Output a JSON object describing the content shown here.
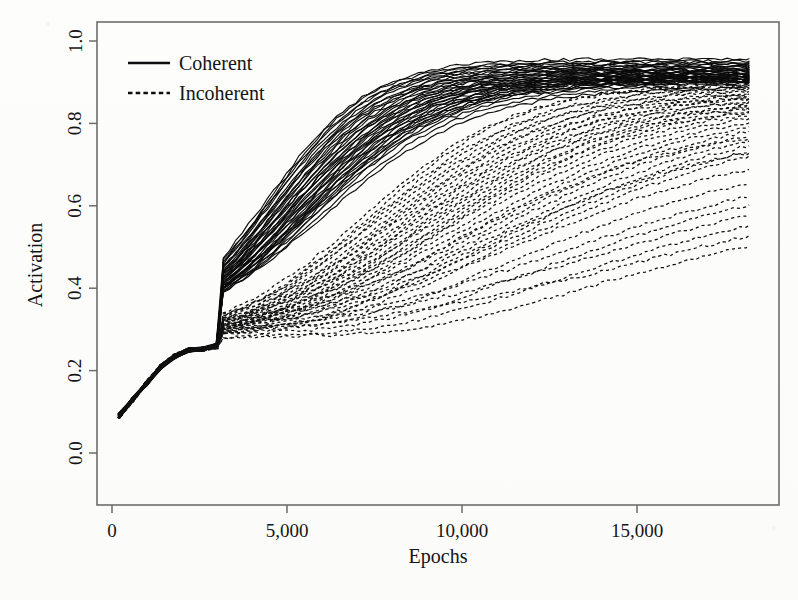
{
  "figure": {
    "background_color": "#fdfdfc",
    "ink_color": "#111111",
    "frame_color": "#6d6d6d"
  },
  "chart_data": {
    "type": "line",
    "title": "",
    "xlabel": "Epochs",
    "ylabel": "Activation",
    "xlim": [
      0,
      18400
    ],
    "ylim": [
      0.0,
      1.0
    ],
    "xticks": [
      0,
      5000,
      10000,
      15000
    ],
    "xticklabels": [
      "0",
      "5,000",
      "10,000",
      "15,000"
    ],
    "yticks": [
      0.0,
      0.2,
      0.4,
      0.6,
      0.8,
      1.0
    ],
    "yticklabels": [
      "0.0",
      "0.2",
      "0.4",
      "0.6",
      "0.8",
      "1.0"
    ],
    "grid": false,
    "legend_position": "top-left",
    "legend": [
      {
        "label": "Coherent",
        "style": "solid"
      },
      {
        "label": "Incoherent",
        "style": "dashed"
      }
    ],
    "x_start_of_data": 200,
    "x_end_of_data": 18200,
    "series_groups": [
      {
        "name": "Coherent",
        "style": "solid",
        "n_traces": 40,
        "description": "Sigmoidal rise beginning near epoch 2800, saturating between 0.88 and 0.96",
        "shared_ramp_x": [
          200,
          600,
          1000,
          1400,
          1800,
          2200,
          2600,
          3000
        ],
        "shared_ramp_y": [
          0.09,
          0.13,
          0.17,
          0.21,
          0.235,
          0.25,
          0.252,
          0.262
        ],
        "traces": [
          {
            "midpoint": 4350,
            "steepness": 1500,
            "plateau": 0.957,
            "base": 0.255
          },
          {
            "midpoint": 4420,
            "steepness": 1530,
            "plateau": 0.951,
            "base": 0.252
          },
          {
            "midpoint": 4500,
            "steepness": 1560,
            "plateau": 0.946,
            "base": 0.256
          },
          {
            "midpoint": 4580,
            "steepness": 1590,
            "plateau": 0.941,
            "base": 0.25
          },
          {
            "midpoint": 4650,
            "steepness": 1610,
            "plateau": 0.936,
            "base": 0.258
          },
          {
            "midpoint": 4720,
            "steepness": 1640,
            "plateau": 0.933,
            "base": 0.249
          },
          {
            "midpoint": 4800,
            "steepness": 1670,
            "plateau": 0.93,
            "base": 0.254
          },
          {
            "midpoint": 4870,
            "steepness": 1700,
            "plateau": 0.927,
            "base": 0.251
          },
          {
            "midpoint": 4940,
            "steepness": 1720,
            "plateau": 0.924,
            "base": 0.257
          },
          {
            "midpoint": 5010,
            "steepness": 1750,
            "plateau": 0.922,
            "base": 0.248
          },
          {
            "midpoint": 5080,
            "steepness": 1780,
            "plateau": 0.919,
            "base": 0.253
          },
          {
            "midpoint": 5150,
            "steepness": 1800,
            "plateau": 0.917,
            "base": 0.255
          },
          {
            "midpoint": 5230,
            "steepness": 1830,
            "plateau": 0.915,
            "base": 0.25
          },
          {
            "midpoint": 5300,
            "steepness": 1860,
            "plateau": 0.913,
            "base": 0.256
          },
          {
            "midpoint": 5370,
            "steepness": 1880,
            "plateau": 0.911,
            "base": 0.252
          },
          {
            "midpoint": 5440,
            "steepness": 1910,
            "plateau": 0.909,
            "base": 0.249
          },
          {
            "midpoint": 5520,
            "steepness": 1940,
            "plateau": 0.907,
            "base": 0.254
          },
          {
            "midpoint": 5590,
            "steepness": 1960,
            "plateau": 0.905,
            "base": 0.251
          },
          {
            "midpoint": 5660,
            "steepness": 1990,
            "plateau": 0.903,
            "base": 0.257
          },
          {
            "midpoint": 5740,
            "steepness": 2020,
            "plateau": 0.901,
            "base": 0.248
          },
          {
            "midpoint": 4390,
            "steepness": 1450,
            "plateau": 0.949,
            "base": 0.253
          },
          {
            "midpoint": 4470,
            "steepness": 1480,
            "plateau": 0.944,
            "base": 0.256
          },
          {
            "midpoint": 4550,
            "steepness": 1510,
            "plateau": 0.939,
            "base": 0.25
          },
          {
            "midpoint": 4630,
            "steepness": 1545,
            "plateau": 0.935,
            "base": 0.255
          },
          {
            "midpoint": 4710,
            "steepness": 1580,
            "plateau": 0.931,
            "base": 0.252
          },
          {
            "midpoint": 4790,
            "steepness": 1615,
            "plateau": 0.928,
            "base": 0.258
          },
          {
            "midpoint": 4860,
            "steepness": 1650,
            "plateau": 0.925,
            "base": 0.249
          },
          {
            "midpoint": 4930,
            "steepness": 1685,
            "plateau": 0.921,
            "base": 0.254
          },
          {
            "midpoint": 5000,
            "steepness": 1715,
            "plateau": 0.918,
            "base": 0.251
          },
          {
            "midpoint": 5090,
            "steepness": 1745,
            "plateau": 0.916,
            "base": 0.256
          },
          {
            "midpoint": 5170,
            "steepness": 1775,
            "plateau": 0.914,
            "base": 0.25
          },
          {
            "midpoint": 5250,
            "steepness": 1810,
            "plateau": 0.912,
            "base": 0.253
          },
          {
            "midpoint": 5330,
            "steepness": 1845,
            "plateau": 0.91,
            "base": 0.257
          },
          {
            "midpoint": 5410,
            "steepness": 1875,
            "plateau": 0.908,
            "base": 0.248
          },
          {
            "midpoint": 5490,
            "steepness": 1905,
            "plateau": 0.906,
            "base": 0.255
          },
          {
            "midpoint": 5570,
            "steepness": 1935,
            "plateau": 0.904,
            "base": 0.252
          },
          {
            "midpoint": 5650,
            "steepness": 1970,
            "plateau": 0.9,
            "base": 0.249
          },
          {
            "midpoint": 5780,
            "steepness": 2050,
            "plateau": 0.897,
            "base": 0.254
          },
          {
            "midpoint": 5880,
            "steepness": 2100,
            "plateau": 0.893,
            "base": 0.251
          },
          {
            "midpoint": 6000,
            "steepness": 2180,
            "plateau": 0.888,
            "base": 0.256
          }
        ]
      },
      {
        "name": "Incoherent",
        "style": "dashed",
        "n_traces": 40,
        "description": "Slow, widely scattered rise; several traces dip below 0.25 near epoch 4000-6000 before climbing; final values between 0.67 and 0.90",
        "shared_ramp_x": [
          200,
          600,
          1000,
          1400,
          1800,
          2200,
          2600,
          3000
        ],
        "shared_ramp_y": [
          0.09,
          0.13,
          0.17,
          0.21,
          0.235,
          0.25,
          0.252,
          0.258
        ],
        "traces": [
          {
            "midpoint": 7200,
            "steepness": 2200,
            "plateau": 0.9,
            "base": 0.25,
            "dip": 0.0
          },
          {
            "midpoint": 7450,
            "steepness": 2300,
            "plateau": 0.893,
            "base": 0.248,
            "dip": 0.004
          },
          {
            "midpoint": 7700,
            "steepness": 2380,
            "plateau": 0.888,
            "base": 0.252,
            "dip": 0.0
          },
          {
            "midpoint": 7950,
            "steepness": 2460,
            "plateau": 0.883,
            "base": 0.246,
            "dip": 0.008
          },
          {
            "midpoint": 8200,
            "steepness": 2540,
            "plateau": 0.879,
            "base": 0.254,
            "dip": 0.0
          },
          {
            "midpoint": 8450,
            "steepness": 2620,
            "plateau": 0.875,
            "base": 0.249,
            "dip": 0.01
          },
          {
            "midpoint": 8700,
            "steepness": 2700,
            "plateau": 0.871,
            "base": 0.251,
            "dip": 0.0
          },
          {
            "midpoint": 8950,
            "steepness": 2790,
            "plateau": 0.867,
            "base": 0.247,
            "dip": 0.012
          },
          {
            "midpoint": 9200,
            "steepness": 2870,
            "plateau": 0.863,
            "base": 0.253,
            "dip": 0.0
          },
          {
            "midpoint": 9450,
            "steepness": 2950,
            "plateau": 0.859,
            "base": 0.25,
            "dip": 0.014
          },
          {
            "midpoint": 9700,
            "steepness": 3040,
            "plateau": 0.855,
            "base": 0.248,
            "dip": 0.0
          },
          {
            "midpoint": 9950,
            "steepness": 3120,
            "plateau": 0.851,
            "base": 0.255,
            "dip": 0.016
          },
          {
            "midpoint": 10200,
            "steepness": 3200,
            "plateau": 0.847,
            "base": 0.246,
            "dip": 0.0
          },
          {
            "midpoint": 10450,
            "steepness": 3290,
            "plateau": 0.843,
            "base": 0.252,
            "dip": 0.018
          },
          {
            "midpoint": 10700,
            "steepness": 3370,
            "plateau": 0.838,
            "base": 0.249,
            "dip": 0.0
          },
          {
            "midpoint": 10950,
            "steepness": 3450,
            "plateau": 0.833,
            "base": 0.254,
            "dip": 0.02
          },
          {
            "midpoint": 11200,
            "steepness": 3540,
            "plateau": 0.828,
            "base": 0.247,
            "dip": 0.0
          },
          {
            "midpoint": 11450,
            "steepness": 3620,
            "plateau": 0.822,
            "base": 0.251,
            "dip": 0.022
          },
          {
            "midpoint": 11700,
            "steepness": 3700,
            "plateau": 0.816,
            "base": 0.25,
            "dip": 0.0
          },
          {
            "midpoint": 11950,
            "steepness": 3790,
            "plateau": 0.81,
            "base": 0.253,
            "dip": 0.024
          },
          {
            "midpoint": 7350,
            "steepness": 2150,
            "plateau": 0.896,
            "base": 0.249,
            "dip": 0.0
          },
          {
            "midpoint": 7600,
            "steepness": 2250,
            "plateau": 0.89,
            "base": 0.252,
            "dip": 0.006
          },
          {
            "midpoint": 7850,
            "steepness": 2340,
            "plateau": 0.885,
            "base": 0.247,
            "dip": 0.0
          },
          {
            "midpoint": 8100,
            "steepness": 2420,
            "plateau": 0.881,
            "base": 0.253,
            "dip": 0.01
          },
          {
            "midpoint": 8350,
            "steepness": 2500,
            "plateau": 0.877,
            "base": 0.248,
            "dip": 0.0
          },
          {
            "midpoint": 8600,
            "steepness": 2580,
            "plateau": 0.873,
            "base": 0.251,
            "dip": 0.013
          },
          {
            "midpoint": 8850,
            "steepness": 2670,
            "plateau": 0.869,
            "base": 0.25,
            "dip": 0.0
          },
          {
            "midpoint": 9100,
            "steepness": 2750,
            "plateau": 0.865,
            "base": 0.254,
            "dip": 0.015
          },
          {
            "midpoint": 9350,
            "steepness": 2830,
            "plateau": 0.861,
            "base": 0.246,
            "dip": 0.0
          },
          {
            "midpoint": 9600,
            "steepness": 2920,
            "plateau": 0.857,
            "base": 0.252,
            "dip": 0.017
          },
          {
            "midpoint": 10050,
            "steepness": 3080,
            "plateau": 0.8,
            "base": 0.249,
            "dip": 0.0
          },
          {
            "midpoint": 10800,
            "steepness": 3420,
            "plateau": 0.782,
            "base": 0.251,
            "dip": 0.026
          },
          {
            "midpoint": 11600,
            "steepness": 3760,
            "plateau": 0.765,
            "base": 0.248,
            "dip": 0.0
          },
          {
            "midpoint": 12300,
            "steepness": 4000,
            "plateau": 0.748,
            "base": 0.253,
            "dip": 0.028
          },
          {
            "midpoint": 12900,
            "steepness": 4250,
            "plateau": 0.733,
            "base": 0.247,
            "dip": 0.0
          },
          {
            "midpoint": 13400,
            "steepness": 4450,
            "plateau": 0.722,
            "base": 0.25,
            "dip": 0.03
          },
          {
            "midpoint": 13900,
            "steepness": 4650,
            "plateau": 0.71,
            "base": 0.252,
            "dip": 0.0
          },
          {
            "midpoint": 14500,
            "steepness": 4900,
            "plateau": 0.696,
            "base": 0.248,
            "dip": 0.032
          },
          {
            "midpoint": 15200,
            "steepness": 5150,
            "plateau": 0.682,
            "base": 0.251,
            "dip": 0.0
          },
          {
            "midpoint": 15900,
            "steepness": 5400,
            "plateau": 0.67,
            "base": 0.249,
            "dip": 0.034
          }
        ]
      }
    ]
  },
  "layout": {
    "plot_left": 97,
    "plot_right": 779,
    "plot_top": 22,
    "plot_bottom": 505,
    "x_pixel_at_0": 112,
    "x_pixels_per_5000": 175,
    "y_pixel_at_0": 453,
    "y_pixel_at_1": 41,
    "legend_x": 128,
    "legend_y_solid": 63,
    "legend_y_dashed": 93,
    "legend_swatch_width": 42,
    "xlabel_x": 438,
    "xlabel_y": 563,
    "ylabel_x": 42,
    "ylabel_y": 265,
    "tick_label_offset_x": 22,
    "tick_label_offset_y": 26,
    "tick_size": 8
  }
}
